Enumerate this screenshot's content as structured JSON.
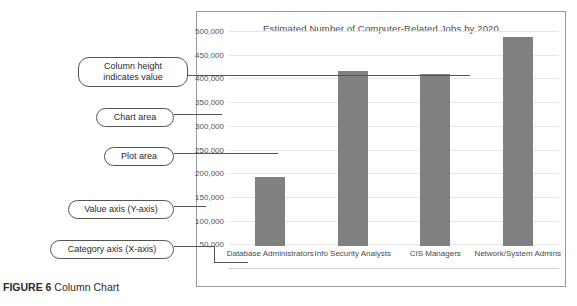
{
  "figure": {
    "number_label": "FIGURE 6",
    "caption": "Column Chart"
  },
  "chart_data": {
    "type": "bar",
    "title": "Estimated Number of Computer-Related Jobs by 2020",
    "xlabel": "",
    "ylabel": "",
    "categories": [
      "Database Administrators",
      "Info Security Analysts",
      "CIS Managers",
      "Network/System Admins"
    ],
    "values": [
      145000,
      370000,
      363000,
      440000
    ],
    "ylim": [
      0,
      500000
    ],
    "ytick_values": [
      50000,
      100000,
      150000,
      200000,
      250000,
      300000,
      350000,
      400000,
      450000,
      500000
    ],
    "ytick_labels": [
      "50,000",
      "100,000",
      "150,000",
      "200,000",
      "250,000",
      "300,000",
      "350,000",
      "400,000",
      "450,000",
      "500,000"
    ],
    "grid": true,
    "legend": false,
    "bar_color": "#808080",
    "plot_background": "#ffffff"
  },
  "annotations": [
    {
      "id": "column-height",
      "text_line1": "Column height",
      "text_line2": "indicates value"
    },
    {
      "id": "chart-area",
      "text_line1": "Chart area",
      "text_line2": ""
    },
    {
      "id": "plot-area",
      "text_line1": "Plot area",
      "text_line2": ""
    },
    {
      "id": "value-axis",
      "text_line1": "Value axis (Y-axis)",
      "text_line2": ""
    },
    {
      "id": "category-axis",
      "text_line1": "Category axis (X-axis)",
      "text_line2": ""
    }
  ]
}
